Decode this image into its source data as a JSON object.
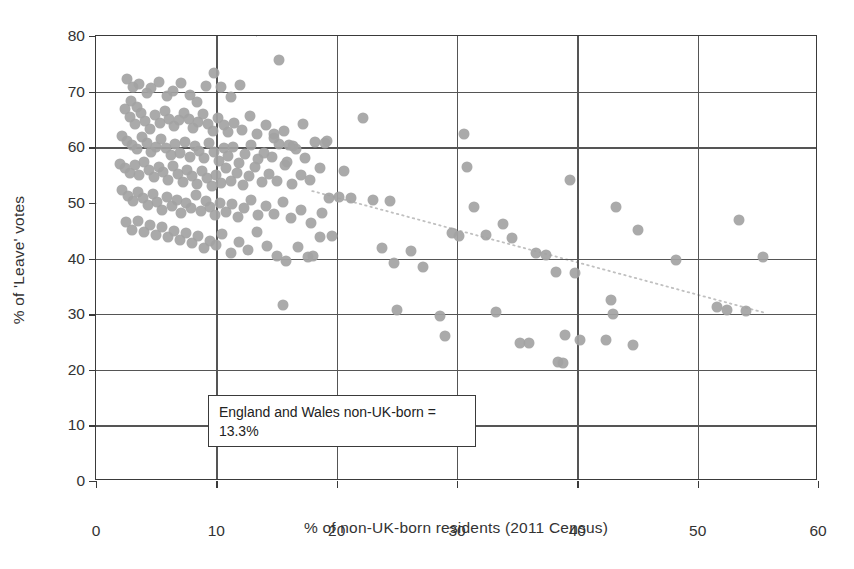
{
  "chart_data": {
    "type": "scatter",
    "title": "",
    "xlabel": "% of non-UK-born residents (2011 Census)",
    "ylabel": "% of 'Leave' votes",
    "xlim": [
      0,
      60
    ],
    "ylim": [
      0,
      80
    ],
    "xticks": [
      0,
      10,
      20,
      30,
      40,
      50,
      60
    ],
    "yticks": [
      0,
      10,
      20,
      30,
      40,
      50,
      60,
      70,
      80
    ],
    "grid": true,
    "legend": "none",
    "marker_color": "#a3a3a3",
    "gridline_color": "#555555",
    "reference_line_color": "#d7d7d7",
    "annotations": [
      {
        "name": "england-wales-average",
        "text_line1": "England and Wales non-UK-born =",
        "text_line2": "13.3%",
        "reference_x": 13.3,
        "reference_y": 50
      }
    ],
    "trend_line": {
      "style": "dotted",
      "color": "#c0c0c0",
      "x_start": 18.0,
      "y_start": 52.0,
      "x_end": 55.8,
      "y_end": 30.0
    },
    "points": [
      [
        2.6,
        72.3
      ],
      [
        3.1,
        70.9
      ],
      [
        3.6,
        71.4
      ],
      [
        4.2,
        69.8
      ],
      [
        2.9,
        68.4
      ],
      [
        3.4,
        67.2
      ],
      [
        4.6,
        70.6
      ],
      [
        5.2,
        71.8
      ],
      [
        5.9,
        69.2
      ],
      [
        6.4,
        70.2
      ],
      [
        7.1,
        71.6
      ],
      [
        7.8,
        69.4
      ],
      [
        8.4,
        68.1
      ],
      [
        9.1,
        71.0
      ],
      [
        9.8,
        73.4
      ],
      [
        10.4,
        70.8
      ],
      [
        11.2,
        69.0
      ],
      [
        12.0,
        71.2
      ],
      [
        2.4,
        66.8
      ],
      [
        2.8,
        65.4
      ],
      [
        3.2,
        64.2
      ],
      [
        3.7,
        66.1
      ],
      [
        4.1,
        64.8
      ],
      [
        4.5,
        63.2
      ],
      [
        4.9,
        65.8
      ],
      [
        5.3,
        64.4
      ],
      [
        5.7,
        66.5
      ],
      [
        6.1,
        65.1
      ],
      [
        6.5,
        63.8
      ],
      [
        6.9,
        64.9
      ],
      [
        7.3,
        66.2
      ],
      [
        7.7,
        65.0
      ],
      [
        8.1,
        63.5
      ],
      [
        8.5,
        64.6
      ],
      [
        8.9,
        66.0
      ],
      [
        9.3,
        64.2
      ],
      [
        9.7,
        63.0
      ],
      [
        10.1,
        65.2
      ],
      [
        10.6,
        64.0
      ],
      [
        11.0,
        62.8
      ],
      [
        11.5,
        64.4
      ],
      [
        12.1,
        63.1
      ],
      [
        12.8,
        65.6
      ],
      [
        13.4,
        62.4
      ],
      [
        14.1,
        64.0
      ],
      [
        14.8,
        61.6
      ],
      [
        15.6,
        62.9
      ],
      [
        16.4,
        60.2
      ],
      [
        2.2,
        62.0
      ],
      [
        2.6,
        61.1
      ],
      [
        3.0,
        60.4
      ],
      [
        3.4,
        59.6
      ],
      [
        3.8,
        61.8
      ],
      [
        4.2,
        60.8
      ],
      [
        4.6,
        59.2
      ],
      [
        5.0,
        60.0
      ],
      [
        5.4,
        61.4
      ],
      [
        5.8,
        59.8
      ],
      [
        6.2,
        58.6
      ],
      [
        6.6,
        60.6
      ],
      [
        7.0,
        59.0
      ],
      [
        7.4,
        61.0
      ],
      [
        7.8,
        58.2
      ],
      [
        8.2,
        60.2
      ],
      [
        8.6,
        59.4
      ],
      [
        9.0,
        58.0
      ],
      [
        9.4,
        60.8
      ],
      [
        9.8,
        59.2
      ],
      [
        10.2,
        57.6
      ],
      [
        10.6,
        59.8
      ],
      [
        11.0,
        58.4
      ],
      [
        11.4,
        60.0
      ],
      [
        11.9,
        57.2
      ],
      [
        12.4,
        58.8
      ],
      [
        12.9,
        60.4
      ],
      [
        13.5,
        57.8
      ],
      [
        14.0,
        59.0
      ],
      [
        14.6,
        58.2
      ],
      [
        15.2,
        60.6
      ],
      [
        15.9,
        57.4
      ],
      [
        16.6,
        59.6
      ],
      [
        17.4,
        58.0
      ],
      [
        18.2,
        61.0
      ],
      [
        19.0,
        60.8
      ],
      [
        2.0,
        57.0
      ],
      [
        2.4,
        56.2
      ],
      [
        2.8,
        55.4
      ],
      [
        3.2,
        56.8
      ],
      [
        3.6,
        55.0
      ],
      [
        4.0,
        57.4
      ],
      [
        4.4,
        56.0
      ],
      [
        4.8,
        54.6
      ],
      [
        5.2,
        56.4
      ],
      [
        5.6,
        55.6
      ],
      [
        6.0,
        54.2
      ],
      [
        6.4,
        56.6
      ],
      [
        6.8,
        55.2
      ],
      [
        7.2,
        53.8
      ],
      [
        7.6,
        56.0
      ],
      [
        8.0,
        54.8
      ],
      [
        8.4,
        53.4
      ],
      [
        8.8,
        55.8
      ],
      [
        9.2,
        54.4
      ],
      [
        9.6,
        53.0
      ],
      [
        10.0,
        55.0
      ],
      [
        10.4,
        53.6
      ],
      [
        10.8,
        56.2
      ],
      [
        11.2,
        54.0
      ],
      [
        11.7,
        55.4
      ],
      [
        12.2,
        53.2
      ],
      [
        12.7,
        54.8
      ],
      [
        13.2,
        56.4
      ],
      [
        13.8,
        53.8
      ],
      [
        14.4,
        55.2
      ],
      [
        15.0,
        54.0
      ],
      [
        15.7,
        56.8
      ],
      [
        16.3,
        53.4
      ],
      [
        17.0,
        55.0
      ],
      [
        17.8,
        54.2
      ],
      [
        18.6,
        56.2
      ],
      [
        19.4,
        50.8
      ],
      [
        20.2,
        51.0
      ],
      [
        2.2,
        52.4
      ],
      [
        2.7,
        51.2
      ],
      [
        3.1,
        50.4
      ],
      [
        3.5,
        52.0
      ],
      [
        3.9,
        50.8
      ],
      [
        4.3,
        49.6
      ],
      [
        4.7,
        51.6
      ],
      [
        5.1,
        50.2
      ],
      [
        5.5,
        48.8
      ],
      [
        5.9,
        51.0
      ],
      [
        6.3,
        49.4
      ],
      [
        6.7,
        50.6
      ],
      [
        7.1,
        48.2
      ],
      [
        7.5,
        50.0
      ],
      [
        7.9,
        49.0
      ],
      [
        8.3,
        51.4
      ],
      [
        8.7,
        48.6
      ],
      [
        9.1,
        50.4
      ],
      [
        9.5,
        49.2
      ],
      [
        9.9,
        47.8
      ],
      [
        10.3,
        50.0
      ],
      [
        10.8,
        48.4
      ],
      [
        11.3,
        49.8
      ],
      [
        11.8,
        47.4
      ],
      [
        12.3,
        49.0
      ],
      [
        12.9,
        50.6
      ],
      [
        13.5,
        47.8
      ],
      [
        14.1,
        49.4
      ],
      [
        14.8,
        48.0
      ],
      [
        15.5,
        50.2
      ],
      [
        16.2,
        47.2
      ],
      [
        17.0,
        48.8
      ],
      [
        17.9,
        46.4
      ],
      [
        18.8,
        48.2
      ],
      [
        2.5,
        46.6
      ],
      [
        3.0,
        45.2
      ],
      [
        3.5,
        46.8
      ],
      [
        4.0,
        44.8
      ],
      [
        4.5,
        46.0
      ],
      [
        5.0,
        44.2
      ],
      [
        5.5,
        45.6
      ],
      [
        6.0,
        43.8
      ],
      [
        6.5,
        45.0
      ],
      [
        7.0,
        43.4
      ],
      [
        7.5,
        44.6
      ],
      [
        8.0,
        42.8
      ],
      [
        8.5,
        44.0
      ],
      [
        9.0,
        41.8
      ],
      [
        9.5,
        43.2
      ],
      [
        10.0,
        42.4
      ],
      [
        10.5,
        44.4
      ],
      [
        11.2,
        41.0
      ],
      [
        11.9,
        43.0
      ],
      [
        12.6,
        41.6
      ],
      [
        13.4,
        44.8
      ],
      [
        14.2,
        42.2
      ],
      [
        15.0,
        40.4
      ],
      [
        15.8,
        39.6
      ],
      [
        16.8,
        42.0
      ],
      [
        17.6,
        40.2
      ],
      [
        18.6,
        43.8
      ],
      [
        15.2,
        75.6
      ],
      [
        14.8,
        62.4
      ],
      [
        16.0,
        60.4
      ],
      [
        17.2,
        64.2
      ],
      [
        19.2,
        61.2
      ],
      [
        15.5,
        31.6
      ],
      [
        18.0,
        40.4
      ],
      [
        19.6,
        44.0
      ],
      [
        20.6,
        55.8
      ],
      [
        21.2,
        50.8
      ],
      [
        22.2,
        65.2
      ],
      [
        23.0,
        50.6
      ],
      [
        23.8,
        41.8
      ],
      [
        24.4,
        50.4
      ],
      [
        24.8,
        39.2
      ],
      [
        25.0,
        30.8
      ],
      [
        26.2,
        41.4
      ],
      [
        27.2,
        38.4
      ],
      [
        28.6,
        29.6
      ],
      [
        29.0,
        26.0
      ],
      [
        29.6,
        44.6
      ],
      [
        30.2,
        44.0
      ],
      [
        30.6,
        62.4
      ],
      [
        30.8,
        56.4
      ],
      [
        31.4,
        49.2
      ],
      [
        32.4,
        44.2
      ],
      [
        33.2,
        30.4
      ],
      [
        33.8,
        46.2
      ],
      [
        34.6,
        43.6
      ],
      [
        35.2,
        24.8
      ],
      [
        36.0,
        24.8
      ],
      [
        36.6,
        41.0
      ],
      [
        37.4,
        40.6
      ],
      [
        38.2,
        37.6
      ],
      [
        38.4,
        21.4
      ],
      [
        38.8,
        21.2
      ],
      [
        39.0,
        26.2
      ],
      [
        39.4,
        54.2
      ],
      [
        39.8,
        37.4
      ],
      [
        40.2,
        25.4
      ],
      [
        42.4,
        25.4
      ],
      [
        42.8,
        32.6
      ],
      [
        43.0,
        30.0
      ],
      [
        43.2,
        49.2
      ],
      [
        44.6,
        24.4
      ],
      [
        45.0,
        45.2
      ],
      [
        48.2,
        39.8
      ],
      [
        51.6,
        31.2
      ],
      [
        52.4,
        30.8
      ],
      [
        53.4,
        47.0
      ],
      [
        54.0,
        30.6
      ],
      [
        55.4,
        40.2
      ]
    ]
  }
}
